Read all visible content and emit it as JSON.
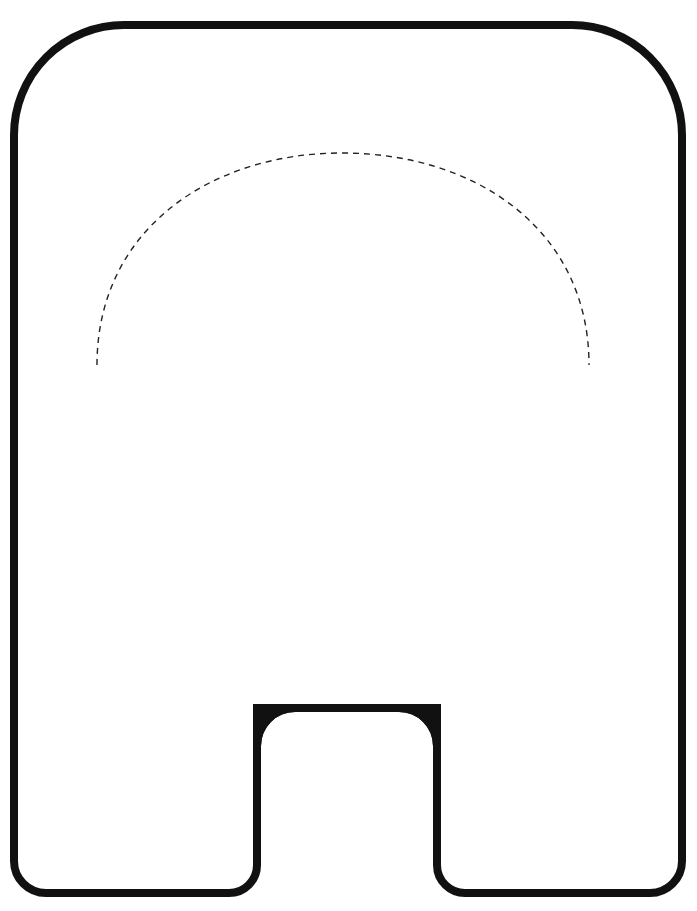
{
  "diagram": {
    "colors": {
      "background": "#ffffff",
      "outline": "#111111",
      "dashed_arc": "#222222"
    },
    "outline": {
      "stroke_width": 8,
      "left": 14,
      "right": 682,
      "top": 25,
      "bottom": 893,
      "top_corner_radius": 110,
      "bottom_corner_radius": 32,
      "notch": {
        "left": 257,
        "right": 437,
        "top": 708,
        "top_band_thickness": 8,
        "inner_corner_radius": 38,
        "outer_foot_radius": 22
      }
    },
    "dashed_arc": {
      "start": [
        97,
        365
      ],
      "apex": [
        342,
        153
      ],
      "end": [
        589,
        365
      ],
      "stroke_width": 1.4,
      "dash": "6 5"
    }
  }
}
